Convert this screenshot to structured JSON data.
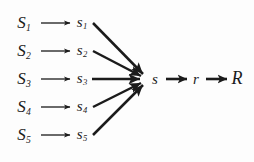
{
  "figure": {
    "width": 254,
    "height": 162,
    "background_color": "#fdfdfd",
    "ink_color": "#1b1b1b"
  },
  "rows": [
    {
      "index": 1,
      "source_label": "S",
      "source_subscript": "1",
      "mid_label": "s",
      "mid_subscript": "1",
      "y": 23
    },
    {
      "index": 2,
      "source_label": "S",
      "source_subscript": "2",
      "mid_label": "s",
      "mid_subscript": "2",
      "y": 51
    },
    {
      "index": 3,
      "source_label": "S",
      "source_subscript": "3",
      "mid_label": "s",
      "mid_subscript": "3",
      "y": 79
    },
    {
      "index": 4,
      "source_label": "S",
      "source_subscript": "4",
      "mid_label": "s",
      "mid_subscript": "4",
      "y": 107
    },
    {
      "index": 5,
      "source_label": "S",
      "source_subscript": "5",
      "mid_label": "s",
      "mid_subscript": "5",
      "y": 135
    }
  ],
  "nodes": {
    "s": "s",
    "r": "r",
    "R": "R"
  },
  "geometry": {
    "source_x": 24,
    "mid_x": 82,
    "thin_arrow_start_x": 41,
    "thin_arrow_end_x": 70,
    "fan_start_x": 92,
    "converge_x": 147,
    "converge_y": 79,
    "node_s_x": 155,
    "node_r_x": 195,
    "node_R_x": 236,
    "bold_arrow1_start_x": 166,
    "bold_arrow1_end_x": 186,
    "bold_arrow2_start_x": 205,
    "bold_arrow2_end_x": 226
  },
  "icons": {
    "thin_arrow": "thin-right-arrow",
    "bold_arrow": "bold-right-arrow",
    "fan_edge": "converging-edge"
  }
}
